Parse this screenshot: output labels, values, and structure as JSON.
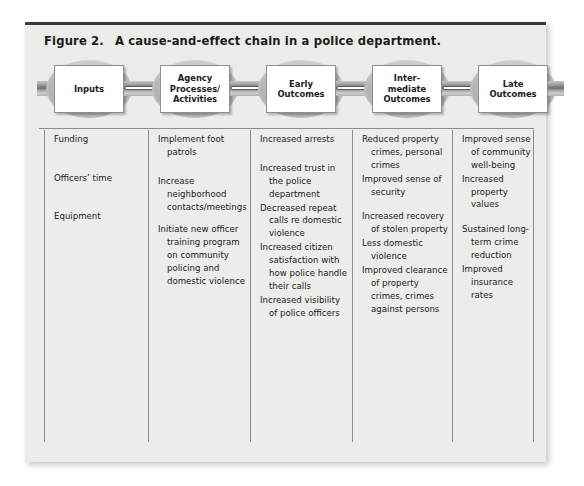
{
  "figure": {
    "number": "Figure 2.",
    "title": "A cause-and-effect chain in a police department."
  },
  "chain": {
    "stages": [
      {
        "label": "Inputs"
      },
      {
        "label": "Agency\nProcesses/\nActivities"
      },
      {
        "label": "Early\nOutcomes"
      },
      {
        "label": "Inter-\nmediate\nOutcomes"
      },
      {
        "label": "Late\nOutcomes"
      }
    ]
  },
  "columns": [
    {
      "stage": "Inputs",
      "entries": [
        "Funding",
        "Officers’ time",
        "Equipment"
      ]
    },
    {
      "stage": "Agency Processes/Activities",
      "entries": [
        "Implement foot patrols",
        "Increase neighborhood contacts/meetings",
        "Initiate new officer training program on community policing and domestic violence"
      ]
    },
    {
      "stage": "Early Outcomes",
      "entries": [
        "Increased arrests",
        "Increased trust in the police department",
        "Decreased repeat calls re domestic violence",
        "Increased citizen satisfaction with how police handle their calls",
        "Increased visibility of police officers"
      ]
    },
    {
      "stage": "Intermediate Outcomes",
      "entries": [
        "Reduced property crimes, personal crimes",
        "Improved sense of security",
        "Increased recovery of stolen property",
        "Less domestic violence",
        "Improved clearance of property crimes, crimes against persons"
      ]
    },
    {
      "stage": "Late Outcomes",
      "entries": [
        "Improved sense of community well-being",
        "Increased property values",
        "Sustained long-term crime reduction",
        "Improved insurance rates"
      ]
    }
  ],
  "colors": {
    "panel_background": "#ececea",
    "top_rule": "#3b3b3b",
    "divider": "#8c8c8a",
    "text": "#222222",
    "box_fill": "#ffffff",
    "link_fill": "#bdbdbb"
  }
}
